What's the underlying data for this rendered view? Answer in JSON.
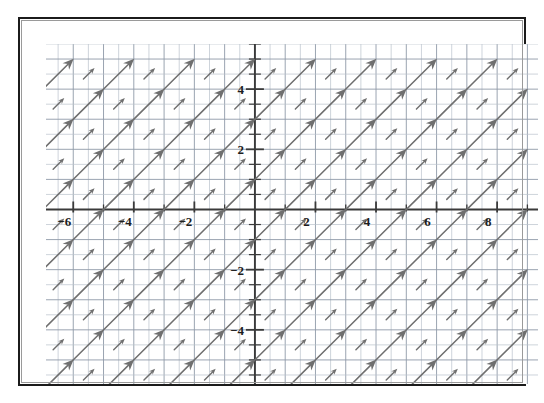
{
  "figure": {
    "title": "",
    "background_color": "#ffffff",
    "frame_color": "#1b1b1b",
    "grid_color": "#8f9aa8",
    "grid_minor_color": "#b9c2cc",
    "axis_color": "#3a3a3a",
    "arrow_color": "#6f6f6f",
    "label_color": "#1d1d1d"
  },
  "chart_data": {
    "type": "scatter",
    "plot_kind": "slope-field",
    "title": "",
    "xlabel": "",
    "ylabel": "",
    "xlim": [
      -6.9,
      9.35
    ],
    "ylim": [
      -5.8,
      5.5
    ],
    "grid": true,
    "grid_step": 0.5,
    "legend": "none",
    "x_ticks": [
      -6,
      -4,
      -2,
      2,
      4,
      6,
      8
    ],
    "x_tick_labels": [
      "−6",
      "−4",
      "−2",
      "2",
      "4",
      "6",
      "8"
    ],
    "y_ticks": [
      4,
      2,
      -2,
      -4
    ],
    "y_tick_labels": [
      "4",
      "2",
      "−2",
      "−4"
    ],
    "x_minor_tick_step": 1,
    "y_minor_tick_step": 1,
    "slope_field": {
      "description": "Direction field of constant slope 1; every segment is drawn at 45 degrees pointing up and to the right.",
      "slope": 1,
      "angle_degrees": 45,
      "arrow_head": "filled triangle at upper-right end",
      "sample_x": [
        -6.5,
        -5.5,
        -4.5,
        -3.5,
        -2.5,
        -1.5,
        -0.5,
        0.5,
        1.5,
        2.5,
        3.5,
        4.5,
        5.5,
        6.5,
        7.5,
        8.5
      ],
      "sample_y": [
        -5.5,
        -4.5,
        -3.5,
        -2.5,
        -1.5,
        -0.5,
        0.5,
        1.5,
        2.5,
        3.5,
        4.5
      ],
      "column_step_units": 1,
      "row_step_units": 1,
      "long_arrow_length_units": 1.45,
      "short_arrow_length_units": 0.52
    }
  },
  "axes": {
    "x_axis_label": "",
    "y_axis_label": "",
    "origin_label": ""
  }
}
